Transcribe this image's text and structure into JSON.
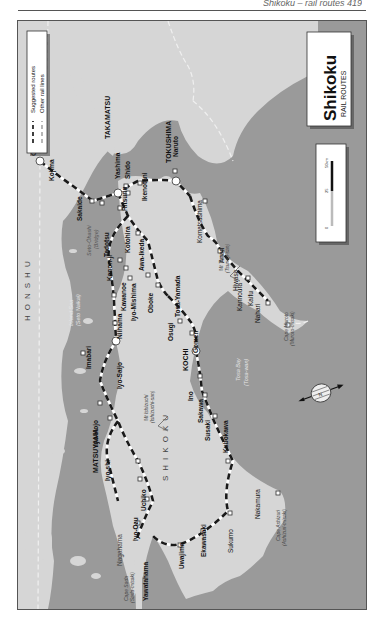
{
  "page": {
    "running_header": "Shikoku – rail routes  419"
  },
  "map": {
    "title": "Shikoku",
    "subtitle": "RAIL ROUTES",
    "colors": {
      "sea": "#9a9a9a",
      "land": "#d6d6d6",
      "route": "#1a1a1a",
      "other_line": "#555555",
      "frame": "#555555",
      "label_sea": "#e6e6e6"
    },
    "legend": {
      "items": [
        {
          "label": "Suggested routes",
          "style": "black-dashed"
        },
        {
          "label": "Other rail lines",
          "style": "grey-dashed"
        }
      ]
    },
    "scale_bar": {
      "ticks": [
        "0",
        "25",
        "50km"
      ]
    },
    "regions": [
      {
        "label": "HONSHU"
      },
      {
        "label": "SHIKOKU"
      }
    ],
    "seas": [
      {
        "label": "Inland Sea",
        "sub": "(Seto Naikai)"
      },
      {
        "label": "Seto-Ōhashi",
        "sub": "(Bridge)"
      },
      {
        "label": "Tosa Bay",
        "sub": "(Tosa-wan)"
      }
    ],
    "mountains": [
      {
        "label": "Mt Ishizuchi",
        "sub": "(Ishizuchi-san)"
      },
      {
        "label": "Mt Tsurugi",
        "sub": "(Tsurugi-san)"
      }
    ],
    "capes": [
      {
        "label": "Cape Muroto",
        "sub": "(Muroto-misaki)"
      },
      {
        "label": "Cape Ashizuri",
        "sub": "(Ashizuri-misaki)"
      },
      {
        "label": "Cape Sada",
        "sub": "(Sada-misaki)"
      }
    ],
    "major_stations": [
      {
        "label": "OKAYAMA"
      },
      {
        "label": "TAKAMATSU"
      },
      {
        "label": "TOKUSHIMA"
      },
      {
        "label": "MATSUYAMA"
      },
      {
        "label": "KOCHI"
      }
    ],
    "stations": [
      {
        "label": "Kojima"
      },
      {
        "label": "Sakaide"
      },
      {
        "label": "Yashima"
      },
      {
        "label": "Shido"
      },
      {
        "label": "Ritsurin"
      },
      {
        "label": "Naruto"
      },
      {
        "label": "Ikenotani"
      },
      {
        "label": "Tadotsu"
      },
      {
        "label": "Kotohira"
      },
      {
        "label": "Awa-Ikeda"
      },
      {
        "label": "Oboke"
      },
      {
        "label": "Kanon-ji"
      },
      {
        "label": "Kawanoe"
      },
      {
        "label": "Iyo-Mishima"
      },
      {
        "label": "Niihama"
      },
      {
        "label": "Iyo-Saijo"
      },
      {
        "label": "Imabari"
      },
      {
        "label": "Osugi"
      },
      {
        "label": "Tosa-Yamada"
      },
      {
        "label": "Gomen"
      },
      {
        "label": "Ino"
      },
      {
        "label": "Sakawa"
      },
      {
        "label": "Susaki"
      },
      {
        "label": "Kubokawa"
      },
      {
        "label": "Iyo-Hojo"
      },
      {
        "label": "Iyo-shi"
      },
      {
        "label": "Uchiko"
      },
      {
        "label": "Iyo-Ozu"
      },
      {
        "label": "Yawatahama"
      },
      {
        "label": "Uwajima"
      },
      {
        "label": "Ekawasaki"
      },
      {
        "label": "Komatsushima"
      },
      {
        "label": "Anan"
      },
      {
        "label": "Hiwasa"
      },
      {
        "label": "Kaifu"
      },
      {
        "label": "Kannoura"
      },
      {
        "label": "Nahari"
      },
      {
        "label": "Nakamura"
      },
      {
        "label": "Sukumo"
      },
      {
        "label": "Nagahama"
      }
    ],
    "compass": {
      "label": "N"
    }
  }
}
